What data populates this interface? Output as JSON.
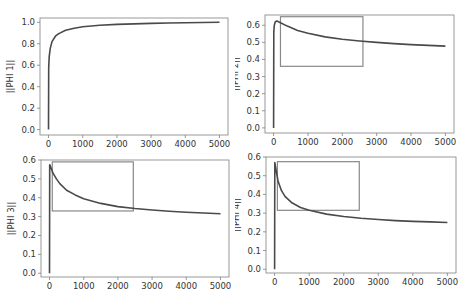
{
  "chart_data": [
    {
      "type": "line",
      "title": "",
      "xlabel": "",
      "ylabel": "||PHI 1||",
      "xlim": [
        -250,
        5250
      ],
      "ylim": [
        -0.05,
        1.04
      ],
      "xticks": [
        0,
        1000,
        2000,
        3000,
        4000,
        5000
      ],
      "yticks": [
        0.0,
        0.2,
        0.4,
        0.6,
        0.8,
        1.0
      ],
      "ytick_labels": [
        "0.0",
        "0.2",
        "0.4",
        "0.6",
        "0.8",
        "1.0"
      ],
      "grid": false,
      "series": [
        {
          "name": "||PHI 1||",
          "x": [
            0,
            5,
            20,
            50,
            100,
            200,
            300,
            500,
            750,
            1000,
            1500,
            2000,
            2500,
            3000,
            3500,
            4000,
            4500,
            5000
          ],
          "values": [
            0.0,
            0.58,
            0.68,
            0.76,
            0.82,
            0.87,
            0.895,
            0.925,
            0.945,
            0.958,
            0.972,
            0.98,
            0.985,
            0.99,
            0.993,
            0.996,
            0.998,
            1.0
          ]
        }
      ],
      "annotation_box": null
    },
    {
      "type": "line",
      "title": "",
      "xlabel": "",
      "ylabel": "||PHI 2||",
      "xlim": [
        -250,
        5250
      ],
      "ylim": [
        -0.03,
        0.66
      ],
      "xticks": [
        0,
        1000,
        2000,
        3000,
        4000,
        5000
      ],
      "yticks": [
        0.0,
        0.1,
        0.2,
        0.3,
        0.4,
        0.5,
        0.6
      ],
      "ytick_labels": [
        "0.0",
        "0.1",
        "0.2",
        "0.3",
        "0.4",
        "0.5",
        "0.6"
      ],
      "grid": false,
      "series": [
        {
          "name": "||PHI 2||",
          "x": [
            0,
            5,
            20,
            50,
            100,
            200,
            400,
            700,
            1000,
            1500,
            2000,
            2500,
            3000,
            3500,
            4000,
            4500,
            5000
          ],
          "values": [
            0.0,
            0.56,
            0.6,
            0.62,
            0.625,
            0.615,
            0.595,
            0.57,
            0.553,
            0.532,
            0.518,
            0.508,
            0.5,
            0.493,
            0.487,
            0.482,
            0.478
          ]
        }
      ],
      "annotation_box": {
        "x0": 200,
        "x1": 2600,
        "y0": 0.36,
        "y1": 0.65
      }
    },
    {
      "type": "line",
      "title": "",
      "xlabel": "",
      "ylabel": "||PHI 3||",
      "xlim": [
        -250,
        5250
      ],
      "ylim": [
        -0.02,
        0.6
      ],
      "xticks": [
        0,
        1000,
        2000,
        3000,
        4000,
        5000
      ],
      "yticks": [
        0.0,
        0.1,
        0.2,
        0.3,
        0.4,
        0.5,
        0.6
      ],
      "ytick_labels": [
        "0.0",
        "0.1",
        "0.2",
        "0.3",
        "0.4",
        "0.5",
        "0.6"
      ],
      "grid": false,
      "series": [
        {
          "name": "||PHI 3||",
          "x": [
            0,
            5,
            20,
            50,
            100,
            200,
            300,
            500,
            750,
            1000,
            1500,
            2000,
            2500,
            3000,
            3500,
            4000,
            4500,
            5000
          ],
          "values": [
            0.0,
            0.575,
            0.57,
            0.555,
            0.53,
            0.5,
            0.475,
            0.44,
            0.415,
            0.395,
            0.37,
            0.353,
            0.343,
            0.335,
            0.328,
            0.323,
            0.319,
            0.315
          ]
        }
      ],
      "annotation_box": {
        "x0": 80,
        "x1": 2450,
        "y0": 0.33,
        "y1": 0.59
      }
    },
    {
      "type": "line",
      "title": "",
      "xlabel": "",
      "ylabel": "||PHI 4||",
      "xlim": [
        -250,
        5250
      ],
      "ylim": [
        -0.02,
        0.6
      ],
      "xticks": [
        0,
        1000,
        2000,
        3000,
        4000,
        5000
      ],
      "yticks": [
        0.0,
        0.1,
        0.2,
        0.3,
        0.4,
        0.5,
        0.6
      ],
      "ytick_labels": [
        "0.0",
        "0.1",
        "0.2",
        "0.3",
        "0.4",
        "0.5",
        "0.6"
      ],
      "grid": false,
      "series": [
        {
          "name": "||PHI 4||",
          "x": [
            0,
            5,
            20,
            50,
            100,
            200,
            300,
            500,
            750,
            1000,
            1500,
            2000,
            2500,
            3000,
            3500,
            4000,
            4500,
            5000
          ],
          "values": [
            0.0,
            0.57,
            0.555,
            0.52,
            0.47,
            0.42,
            0.39,
            0.355,
            0.33,
            0.315,
            0.295,
            0.282,
            0.273,
            0.266,
            0.26,
            0.256,
            0.253,
            0.25
          ]
        }
      ],
      "annotation_box": {
        "x0": 80,
        "x1": 2450,
        "y0": 0.315,
        "y1": 0.575
      }
    }
  ],
  "colors": {
    "line": "#4a4a4a",
    "box": "#888888",
    "axis": "#7f7f7f",
    "text": "#333333"
  },
  "panels": [
    {
      "ylabel": "||PHI 1||"
    },
    {
      "ylabel": "||PHI 2||"
    },
    {
      "ylabel": "||PHI 3||"
    },
    {
      "ylabel": "||PHI 4||"
    }
  ]
}
